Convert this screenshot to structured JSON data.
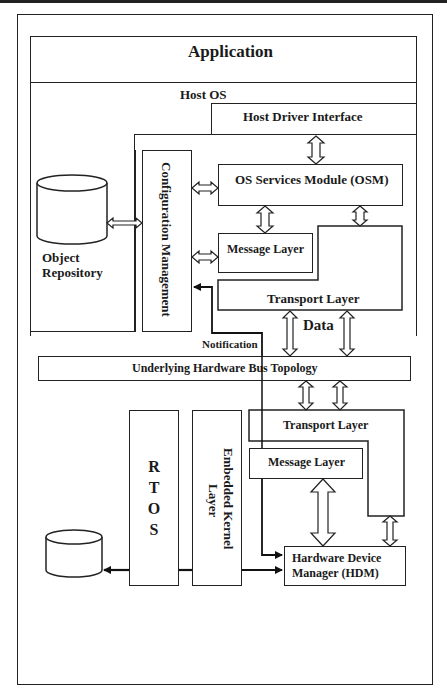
{
  "diagram": {
    "application": "Application",
    "host_os": "Host OS",
    "host_driver_interface": "Host Driver Interface",
    "configuration_management": "Configuration Management",
    "os_services_module": "OS Services Module (OSM)",
    "object_repository_line1": "Object",
    "object_repository_line2": "Repository",
    "host_message_layer": "Message Layer",
    "host_transport_layer": "Transport Layer",
    "data_label": "Data",
    "notification_label": "Notification",
    "bus_topology": "Underlying Hardware Bus Topology",
    "embedded_transport_layer": "Transport Layer",
    "embedded_message_layer": "Message Layer",
    "rtos": "R T O S",
    "embedded_kernel_line1": "Embedded Kernel",
    "embedded_kernel_line2": "Layer",
    "hdm_line1": "Hardware Device",
    "hdm_line2": "Manager (HDM)"
  }
}
